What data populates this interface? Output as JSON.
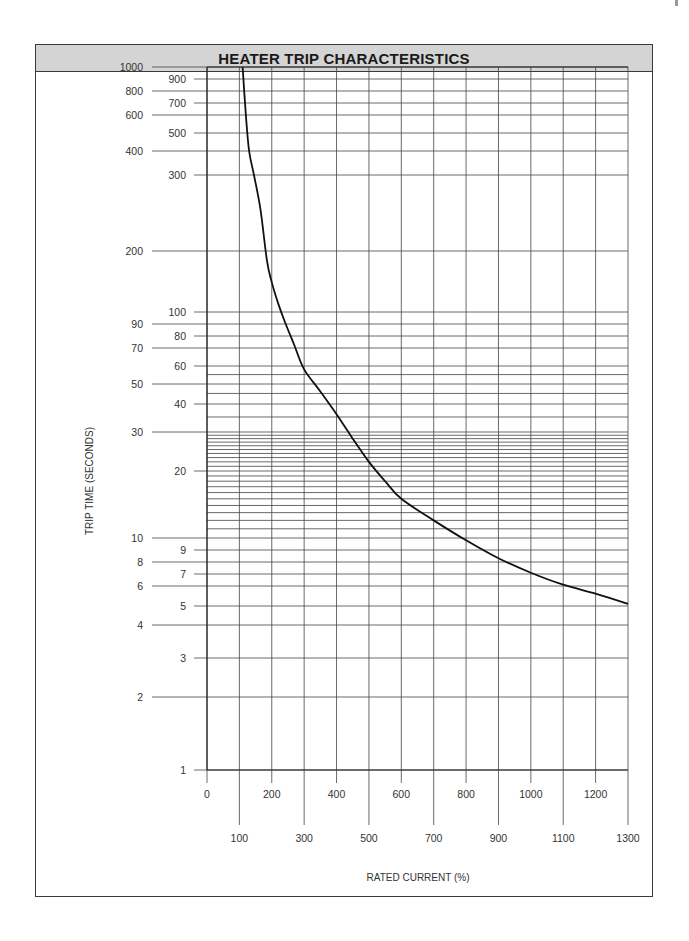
{
  "chart_data": {
    "type": "line",
    "title": "HEATER TRIP CHARACTERISTICS",
    "xlabel": "RATED CURRENT (%)",
    "ylabel": "TRIP TIME (SECONDS)",
    "xlim": [
      0,
      1300
    ],
    "ylim": [
      1,
      1000
    ],
    "yscale": "custom-log-like",
    "grid": true,
    "legend": "none",
    "x_ticks_upper_row": [
      "0",
      "200",
      "400",
      "600",
      "800",
      "1000",
      "1200"
    ],
    "x_ticks_lower_row": [
      "100",
      "300",
      "500",
      "700",
      "900",
      "1100",
      "1300"
    ],
    "x_tick_values_upper": [
      0,
      200,
      400,
      600,
      800,
      1000,
      1200
    ],
    "x_tick_values_lower": [
      100,
      300,
      500,
      700,
      900,
      1100,
      1300
    ],
    "y_ticks_outer": [
      "1000",
      "800",
      "600",
      "400",
      "200",
      "90",
      "70",
      "50",
      "30",
      "10",
      "8",
      "6",
      "4",
      "2"
    ],
    "y_tick_values_outer": [
      1000,
      800,
      600,
      400,
      200,
      90,
      70,
      50,
      30,
      10,
      8,
      6,
      4,
      2
    ],
    "y_ticks_inner": [
      "900",
      "700",
      "500",
      "300",
      "100",
      "80",
      "60",
      "40",
      "20",
      "9",
      "7",
      "5",
      "3",
      "1"
    ],
    "y_tick_values_inner": [
      900,
      700,
      500,
      300,
      100,
      80,
      60,
      40,
      20,
      9,
      7,
      5,
      3,
      1
    ],
    "y_gridlines": [
      1000,
      900,
      800,
      700,
      600,
      500,
      400,
      300,
      200,
      100,
      90,
      80,
      70,
      60,
      55,
      50,
      45,
      40,
      35,
      30,
      29,
      28,
      27,
      26,
      25,
      24,
      23,
      22,
      21,
      20,
      19,
      18,
      17,
      16,
      15,
      14,
      13,
      12,
      11,
      10,
      9,
      8,
      7,
      6,
      5,
      4,
      3,
      2,
      1
    ],
    "series": [
      {
        "name": "Heater trip curve",
        "x": [
          110,
          120,
          130,
          145,
          165,
          185,
          200,
          220,
          240,
          270,
          300,
          350,
          400,
          450,
          500,
          550,
          600,
          700,
          800,
          900,
          1000,
          1100,
          1200,
          1300
        ],
        "y": [
          1000,
          600,
          400,
          300,
          250,
          180,
          140,
          110,
          92,
          72,
          58,
          46,
          36,
          28,
          22,
          18,
          15,
          12,
          9.8,
          8.3,
          7.1,
          6.1,
          5.6,
          5.1
        ]
      }
    ]
  }
}
